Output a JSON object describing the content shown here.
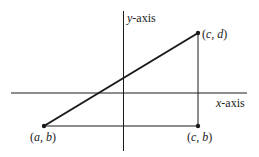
{
  "diagram": {
    "type": "coordinate-geometry",
    "axes": {
      "x_label_var": "x",
      "x_label_suffix": "-axis",
      "y_label_var": "y",
      "y_label_suffix": "-axis"
    },
    "points": [
      {
        "id": "ab",
        "label_open": "(",
        "var1": "a",
        "sep": ", ",
        "var2": "b",
        "label_close": ")"
      },
      {
        "id": "cb",
        "label_open": "(",
        "var1": "c",
        "sep": ", ",
        "var2": "b",
        "label_close": ")"
      },
      {
        "id": "cd",
        "label_open": "(",
        "var1": "c",
        "sep": ", ",
        "var2": "d",
        "label_close": ")"
      }
    ],
    "colors": {
      "line": "#1a1a1a",
      "background": "#ffffff"
    }
  }
}
